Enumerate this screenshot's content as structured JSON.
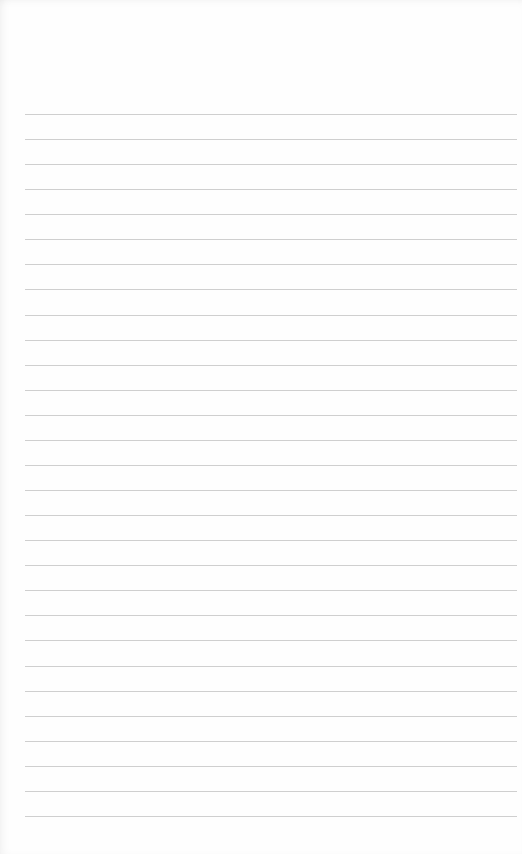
{
  "page": {
    "type": "lined-paper",
    "background_color": "#fefefe",
    "rule_color": "#cfcfcf",
    "rule_count": 29,
    "first_rule_y": 114,
    "rule_spacing": 25.07,
    "rule_left": 25,
    "rule_right": 517
  }
}
